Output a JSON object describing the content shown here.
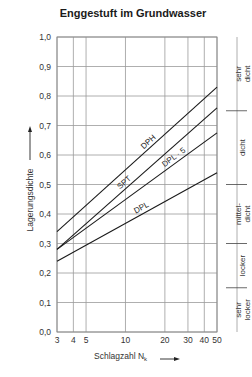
{
  "chart_data": {
    "type": "line",
    "title": "Enggestuft im Grundwasser",
    "xlabel": "Schlagzahl N",
    "xlabel_subscript": "k",
    "ylabel": "Lagerungsdichte",
    "x_scale": "log",
    "xlim": [
      3,
      50
    ],
    "ylim": [
      0.0,
      1.0
    ],
    "x_ticks": [
      3,
      4,
      5,
      10,
      20,
      30,
      40,
      50
    ],
    "x_tick_labels": [
      "3",
      "4",
      "5",
      "10",
      "20",
      "30",
      "40",
      "50"
    ],
    "y_ticks": [
      0.0,
      0.1,
      0.2,
      0.3,
      0.4,
      0.5,
      0.6,
      0.7,
      0.8,
      0.9,
      1.0
    ],
    "y_tick_labels": [
      "0,0",
      "0,1",
      "0,2",
      "0,3",
      "0,4",
      "0,5",
      "0,6",
      "0,7",
      "0,8",
      "0,9",
      "1,0"
    ],
    "grid": true,
    "legend": "inline labels",
    "series": [
      {
        "name": "DPH",
        "x": [
          3,
          50
        ],
        "values": [
          0.34,
          0.83
        ]
      },
      {
        "name": "SPT",
        "x": [
          3,
          50
        ],
        "values": [
          0.28,
          0.76
        ]
      },
      {
        "name": "DPL · 5",
        "x": [
          3,
          50
        ],
        "values": [
          0.28,
          0.675
        ]
      },
      {
        "name": "DPL",
        "x": [
          3,
          50
        ],
        "values": [
          0.24,
          0.54
        ]
      }
    ],
    "zones": [
      {
        "label": "sehr dicht",
        "from": 0.75,
        "to": 1.0
      },
      {
        "label": "dicht",
        "from": 0.5,
        "to": 0.75
      },
      {
        "label": "mittel-dicht",
        "from": 0.3,
        "to": 0.5
      },
      {
        "label": "locker",
        "from": 0.15,
        "to": 0.3
      },
      {
        "label": "sehr locker",
        "from": 0.0,
        "to": 0.15
      }
    ]
  }
}
